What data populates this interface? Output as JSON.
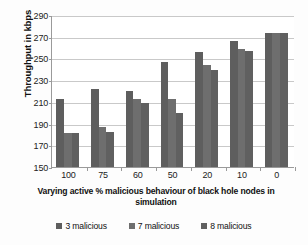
{
  "chart_data": {
    "type": "bar",
    "title": "",
    "xlabel": "Varying  active % malicious behaviour of black hole nodes in simulation",
    "ylabel": "Throughput in kbps",
    "categories": [
      "100",
      "75",
      "60",
      "50",
      "20",
      "10",
      "0"
    ],
    "series": [
      {
        "name": "3 malicious",
        "color": "#5e5e5e",
        "values": [
          213,
          222,
          220,
          247,
          256,
          266,
          273
        ]
      },
      {
        "name": "7 malicious",
        "color": "#6e6e6e",
        "values": [
          181,
          187,
          213,
          213,
          244,
          259,
          273
        ]
      },
      {
        "name": "8 malicious",
        "color": "#606060",
        "values": [
          181,
          182,
          209,
          200,
          239,
          257,
          273
        ]
      }
    ],
    "ylim": [
      150,
      290
    ],
    "yticks": [
      150,
      170,
      190,
      210,
      230,
      250,
      270,
      290
    ],
    "ytick_labels": [
      "150",
      "170",
      "190",
      "210",
      "230",
      "250",
      "270",
      "290"
    ],
    "grid": true,
    "legend_position": "bottom",
    "axis_color": "#9a9a9a",
    "grid_color": "#c9c9c9",
    "background": "#ffffff"
  },
  "legend": {
    "items": [
      {
        "label": "3 malicious",
        "color": "#5e5e5e"
      },
      {
        "label": "7 malicious",
        "color": "#6e6e6e"
      },
      {
        "label": "8 malicious",
        "color": "#606060"
      }
    ]
  }
}
